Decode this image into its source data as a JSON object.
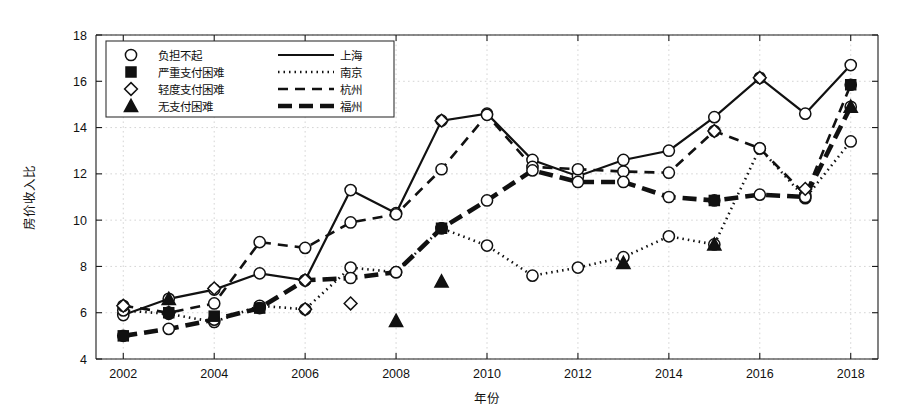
{
  "figure": {
    "background": "#ffffff",
    "foreground": "#111111",
    "gridline_color": "#c9c9c9"
  },
  "axes": {
    "x_title": "年份",
    "y_title": "房价收入比",
    "x_ticks": [
      "2002",
      "2004",
      "2006",
      "2008",
      "2010",
      "2012",
      "2014",
      "2016",
      "2018"
    ],
    "y_ticks": [
      "4",
      "6",
      "8",
      "10",
      "12",
      "14",
      "16",
      "18"
    ],
    "xlim": [
      2001.4,
      2018.6
    ],
    "ylim": [
      4,
      18
    ],
    "grid": true
  },
  "legend": {
    "position": "top-left",
    "rows": [
      {
        "marker": "circle-open-icon",
        "marker_label": "负担不起",
        "line": "solid",
        "line_label": "上海"
      },
      {
        "marker": "square-filled-icon",
        "marker_label": "严重支付困难",
        "line": "dotted",
        "line_label": "南京"
      },
      {
        "marker": "diamond-open-icon",
        "marker_label": "轻度支付困难",
        "line": "dashed",
        "line_label": "杭州"
      },
      {
        "marker": "triangle-filled-icon",
        "marker_label": "无支付困难",
        "line": "thick-solid",
        "line_label": "福州"
      }
    ]
  },
  "chart_data": {
    "type": "line",
    "title": "",
    "xlabel": "年份",
    "ylabel": "房价收入比",
    "xlim": [
      2001.4,
      2018.6
    ],
    "ylim": [
      4,
      18
    ],
    "x": [
      2002,
      2003,
      2004,
      2005,
      2006,
      2007,
      2008,
      2009,
      2010,
      2011,
      2012,
      2013,
      2014,
      2015,
      2016,
      2017,
      2018
    ],
    "series": [
      {
        "name": "上海",
        "line_style": "solid",
        "marker": "circle-open",
        "legend_category": "负担不起",
        "values": [
          5.9,
          6.6,
          7.0,
          7.7,
          7.4,
          11.3,
          10.3,
          14.3,
          14.6,
          12.6,
          11.9,
          12.6,
          13.0,
          14.45,
          16.15,
          14.6,
          16.7
        ]
      },
      {
        "name": "南京",
        "line_style": "dotted",
        "marker": "circle-open",
        "legend_category": "严重支付困难",
        "values": [
          6.1,
          5.95,
          5.6,
          6.3,
          6.15,
          7.95,
          7.75,
          9.65,
          8.9,
          7.6,
          7.95,
          8.4,
          9.3,
          8.95,
          13.1,
          10.95,
          13.4
        ]
      },
      {
        "name": "杭州",
        "line_style": "dashed",
        "marker": "circle-open",
        "legend_category": "轻度支付困难",
        "values": [
          6.3,
          6.0,
          6.4,
          9.05,
          8.8,
          9.9,
          10.25,
          12.2,
          14.55,
          12.3,
          12.2,
          12.1,
          12.05,
          13.85,
          13.1,
          11.1,
          15.85
        ]
      },
      {
        "name": "福州",
        "line_style": "thick-solid",
        "marker": "circle-open",
        "legend_category": "无支付困难",
        "values": [
          5.0,
          5.3,
          5.7,
          6.2,
          7.4,
          7.5,
          7.75,
          9.65,
          10.85,
          12.15,
          11.65,
          11.65,
          11.0,
          10.85,
          11.1,
          11.0,
          14.9
        ]
      }
    ],
    "marker_overlays": [
      {
        "marker": "diamond-open",
        "x": 2002,
        "y": 6.3
      },
      {
        "marker": "diamond-open",
        "x": 2003,
        "y": 6.0
      },
      {
        "marker": "diamond-open",
        "x": 2004,
        "y": 7.05
      },
      {
        "marker": "diamond-open",
        "x": 2006,
        "y": 7.4
      },
      {
        "marker": "diamond-open",
        "x": 2006,
        "y": 6.15
      },
      {
        "marker": "diamond-open",
        "x": 2007,
        "y": 6.4
      },
      {
        "marker": "diamond-open",
        "x": 2009,
        "y": 14.3
      },
      {
        "marker": "diamond-open",
        "x": 2015,
        "y": 13.85
      },
      {
        "marker": "diamond-open",
        "x": 2016,
        "y": 16.15
      },
      {
        "marker": "diamond-open",
        "x": 2017,
        "y": 11.35
      },
      {
        "marker": "square-filled",
        "x": 2002,
        "y": 5.0
      },
      {
        "marker": "square-filled",
        "x": 2003,
        "y": 6.0
      },
      {
        "marker": "square-filled",
        "x": 2004,
        "y": 5.85
      },
      {
        "marker": "square-filled",
        "x": 2005,
        "y": 6.2
      },
      {
        "marker": "square-filled",
        "x": 2009,
        "y": 9.65
      },
      {
        "marker": "square-filled",
        "x": 2015,
        "y": 10.85
      },
      {
        "marker": "square-filled",
        "x": 2018,
        "y": 15.85
      },
      {
        "marker": "triangle-filled",
        "x": 2003,
        "y": 6.6
      },
      {
        "marker": "triangle-filled",
        "x": 2008,
        "y": 5.65
      },
      {
        "marker": "triangle-filled",
        "x": 2009,
        "y": 7.35
      },
      {
        "marker": "triangle-filled",
        "x": 2013,
        "y": 8.15
      },
      {
        "marker": "triangle-filled",
        "x": 2015,
        "y": 8.95
      },
      {
        "marker": "triangle-filled",
        "x": 2018,
        "y": 14.9
      }
    ]
  }
}
